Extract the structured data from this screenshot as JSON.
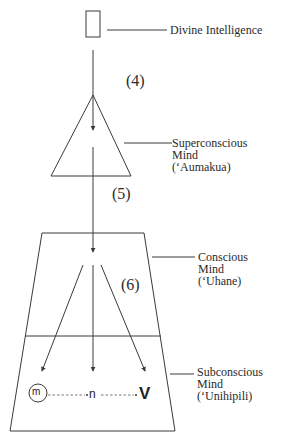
{
  "diagram": {
    "type": "flow",
    "labels": {
      "divine": "Divine Intelligence",
      "super_line1": "Superconscious",
      "super_line2": "Mind",
      "super_line3": "(‘Aumakua)",
      "conscious_line1": "Conscious",
      "conscious_line2": "Mind",
      "conscious_line3": "(‘Uhane)",
      "sub_line1": "Subconscious",
      "sub_line2": "Mind",
      "sub_line3": "(‘Unihipili)"
    },
    "step_numbers": {
      "step4": "(4)",
      "step5": "(5)",
      "step6": "(6)"
    },
    "subconscious_symbols": {
      "m": "m",
      "n": "n",
      "v": "V"
    },
    "nodes": [
      {
        "id": "divine",
        "shape": "rectangle",
        "label": "Divine Intelligence"
      },
      {
        "id": "superconscious",
        "shape": "triangle",
        "label": "Superconscious Mind (‘Aumakua)"
      },
      {
        "id": "conscious",
        "shape": "trapezoid-upper",
        "label": "Conscious Mind (‘Uhane)"
      },
      {
        "id": "subconscious",
        "shape": "trapezoid-lower",
        "label": "Subconscious Mind (‘Unihipili)"
      }
    ],
    "edges": [
      {
        "from": "divine",
        "to": "superconscious",
        "label": "(4)"
      },
      {
        "from": "superconscious",
        "to": "conscious",
        "label": "(5)"
      },
      {
        "from": "conscious",
        "to": "subconscious",
        "label": "(6)",
        "count": 3
      }
    ],
    "colors": {
      "stroke": "#3a3a3a",
      "text": "#2a2a2a",
      "background": "#ffffff"
    }
  }
}
